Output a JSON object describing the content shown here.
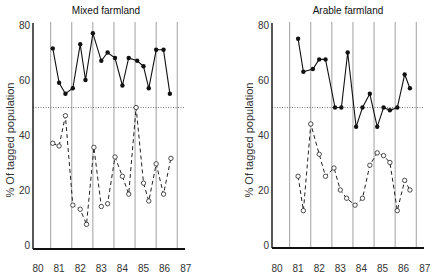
{
  "figure": {
    "width": 437,
    "height": 278,
    "colors": {
      "axis": "#111111",
      "grid": "#888888",
      "ref_line": "#555555",
      "solid": "#111111",
      "dashed": "#222222"
    }
  },
  "chart_data": [
    {
      "type": "line",
      "title": "Mixed farmland",
      "xlabel": "",
      "ylabel": "% Of tagged population",
      "x_ticks": [
        "80",
        "81",
        "82",
        "83",
        "84",
        "85",
        "86",
        "87"
      ],
      "y_ticks": [
        "0",
        "20",
        "40",
        "60",
        "80"
      ],
      "ylim": [
        0,
        80
      ],
      "xlim": [
        80,
        87
      ],
      "grid": "vertical lines at year boundaries",
      "reference_line": {
        "y": 50,
        "style": "dotted"
      },
      "series": [
        {
          "name": "solid (filled markers)",
          "style": "solid",
          "marker": "filled-circle",
          "x": [
            80.7,
            81.0,
            81.3,
            81.65,
            82.0,
            82.25,
            82.6,
            83.0,
            83.3,
            83.65,
            84.0,
            84.3,
            84.7,
            85.0,
            85.25,
            85.6,
            85.95,
            86.25
          ],
          "values": [
            71.5,
            59,
            55,
            57,
            73,
            60,
            77,
            67,
            70,
            68,
            58,
            68,
            67,
            65,
            57,
            71,
            71,
            55
          ]
        },
        {
          "name": "dashed (open markers)",
          "style": "dashed",
          "marker": "open-circle",
          "x": [
            80.7,
            81.0,
            81.3,
            81.65,
            82.0,
            82.3,
            82.65,
            83.0,
            83.3,
            83.65,
            84.0,
            84.3,
            84.65,
            85.0,
            85.25,
            85.6,
            85.95,
            86.3
          ],
          "values": [
            37,
            36,
            47,
            14.5,
            13,
            7.5,
            35.5,
            14,
            15,
            32,
            25,
            18.5,
            50,
            22.5,
            16,
            29.5,
            18.5,
            31.5
          ]
        }
      ]
    },
    {
      "type": "line",
      "title": "Arable farmland",
      "xlabel": "",
      "ylabel": "% Of tagged population",
      "x_ticks": [
        "80",
        "81",
        "82",
        "83",
        "84",
        "85",
        "86",
        "87"
      ],
      "y_ticks": [
        "0",
        "20",
        "40",
        "60",
        "80"
      ],
      "ylim": [
        0,
        80
      ],
      "xlim": [
        80,
        87
      ],
      "grid": "vertical lines at year boundaries",
      "reference_line": {
        "y": 50,
        "style": "dotted"
      },
      "series": [
        {
          "name": "solid (filled markers)",
          "style": "solid",
          "marker": "filled-circle",
          "x": [
            81.0,
            81.25,
            81.7,
            82.0,
            82.3,
            82.75,
            83.05,
            83.35,
            83.75,
            84.05,
            84.4,
            84.75,
            85.05,
            85.35,
            85.7,
            86.05,
            86.3
          ],
          "values": [
            75,
            63,
            64,
            67.5,
            67.5,
            50,
            50,
            70,
            43,
            50,
            55,
            43,
            50,
            49,
            50,
            62,
            57
          ]
        },
        {
          "name": "dashed (open markers)",
          "style": "dashed",
          "marker": "open-circle",
          "x": [
            81.0,
            81.25,
            81.6,
            82.0,
            82.3,
            82.7,
            83.0,
            83.3,
            83.7,
            84.05,
            84.4,
            84.75,
            85.05,
            85.35,
            85.7,
            86.05,
            86.3
          ],
          "values": [
            25,
            12.5,
            44,
            33,
            25,
            28,
            20,
            17,
            14.5,
            17,
            29,
            33.5,
            32.5,
            30,
            12.5,
            23.5,
            20
          ]
        }
      ]
    }
  ]
}
